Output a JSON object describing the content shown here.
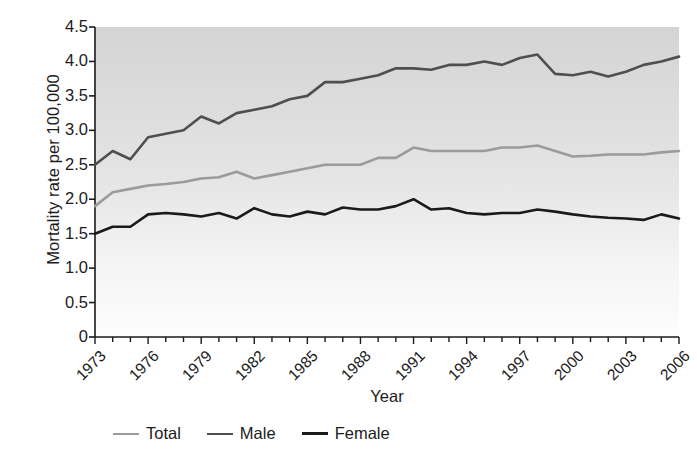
{
  "chart_data": {
    "type": "line",
    "title": "",
    "xlabel": "Year",
    "ylabel": "Mortality rate per 100,000",
    "xlim": [
      1973,
      2006
    ],
    "ylim": [
      0,
      4.5
    ],
    "ytick_labels": [
      "4.5",
      "4.0",
      "3.5",
      "3.0",
      "2.5",
      "2.0",
      "1.5",
      "1.0",
      "0.5",
      "0"
    ],
    "ytick_values": [
      4.5,
      4.0,
      3.5,
      3.0,
      2.5,
      2.0,
      1.5,
      1.0,
      0.5,
      0
    ],
    "xtick_labels": [
      "1973",
      "1976",
      "1979",
      "1982",
      "1985",
      "1988",
      "1991",
      "1994",
      "1997",
      "2000",
      "2003",
      "2006"
    ],
    "xtick_values": [
      1973,
      1976,
      1979,
      1982,
      1985,
      1988,
      1991,
      1994,
      1997,
      2000,
      2003,
      2006
    ],
    "minor_xticks_every": 1,
    "grid": false,
    "legend_position": "below-axes-left",
    "x": [
      1973,
      1974,
      1975,
      1976,
      1977,
      1978,
      1979,
      1980,
      1981,
      1982,
      1983,
      1984,
      1985,
      1986,
      1987,
      1988,
      1989,
      1990,
      1991,
      1992,
      1993,
      1994,
      1995,
      1996,
      1997,
      1998,
      1999,
      2000,
      2001,
      2002,
      2003,
      2004,
      2005,
      2006
    ],
    "series": [
      {
        "name": "Total",
        "color": "#9b9b9b",
        "values": [
          1.9,
          2.1,
          2.15,
          2.2,
          2.22,
          2.25,
          2.3,
          2.32,
          2.4,
          2.3,
          2.35,
          2.4,
          2.45,
          2.5,
          2.5,
          2.5,
          2.6,
          2.6,
          2.75,
          2.7,
          2.7,
          2.7,
          2.7,
          2.75,
          2.75,
          2.78,
          2.7,
          2.62,
          2.63,
          2.65,
          2.65,
          2.65,
          2.68,
          2.7
        ]
      },
      {
        "name": "Male",
        "color": "#4f4f4f",
        "values": [
          2.5,
          2.7,
          2.58,
          2.9,
          2.95,
          3.0,
          3.2,
          3.1,
          3.25,
          3.3,
          3.35,
          3.45,
          3.5,
          3.7,
          3.7,
          3.75,
          3.8,
          3.9,
          3.9,
          3.88,
          3.95,
          3.95,
          4.0,
          3.95,
          4.05,
          4.1,
          3.82,
          3.8,
          3.85,
          3.78,
          3.85,
          3.95,
          4.0,
          4.07
        ]
      },
      {
        "name": "Female",
        "color": "#1a1a1a",
        "values": [
          1.5,
          1.6,
          1.6,
          1.78,
          1.8,
          1.78,
          1.75,
          1.8,
          1.72,
          1.87,
          1.78,
          1.75,
          1.82,
          1.78,
          1.88,
          1.85,
          1.85,
          1.9,
          2.0,
          1.85,
          1.87,
          1.8,
          1.78,
          1.8,
          1.8,
          1.85,
          1.82,
          1.78,
          1.75,
          1.73,
          1.72,
          1.7,
          1.78,
          1.72
        ]
      }
    ]
  },
  "colors": {
    "total": "#9b9b9b",
    "male": "#4f4f4f",
    "female": "#1a1a1a",
    "axis": "#1a1a1a",
    "plot_bg_top": "#d6d6d6",
    "plot_bg_bottom": "#fdfdfd"
  }
}
